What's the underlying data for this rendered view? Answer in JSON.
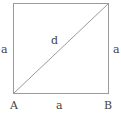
{
  "diagram": {
    "shape": "square",
    "stroke_color": "#9a9a9a",
    "label_color": "#444444",
    "labels": {
      "left_side": "a",
      "right_side": "a",
      "bottom_side": "a",
      "diagonal": "d",
      "vertex_bottom_left": "A",
      "vertex_bottom_right": "B"
    },
    "geometry": {
      "square": {
        "x": 13,
        "y": 3,
        "width": 95,
        "height": 90
      },
      "diagonal": {
        "from": "bottom-left",
        "to": "top-right"
      }
    }
  }
}
